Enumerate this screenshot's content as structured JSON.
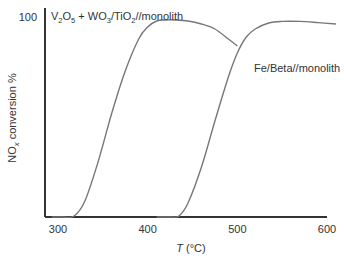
{
  "chart_data": {
    "type": "line",
    "title": "",
    "xlabel_italic": "T",
    "xlabel_rest": " (°C)",
    "ylabel_main": "NO",
    "ylabel_sub": "x",
    "ylabel_rest": " conversion %",
    "xlim": [
      285,
      610
    ],
    "ylim": [
      0,
      100
    ],
    "x_ticks": [
      300,
      400,
      500,
      600
    ],
    "x_tick_labels": [
      "300",
      "400",
      "500",
      "600"
    ],
    "y_ticks": [
      100
    ],
    "y_tick_labels": [
      "100"
    ],
    "grid": false,
    "series": [
      {
        "name": "V2O5 + WO3/TiO2//monolith",
        "label_parts": [
          "V",
          "2",
          "O",
          "5",
          " + WO",
          "3",
          "/TiO",
          "2",
          "//monolith"
        ],
        "color": "#777777",
        "x": [
          293,
          305,
          318,
          330,
          345,
          360,
          375,
          390,
          400,
          410,
          420,
          430,
          445,
          460,
          475,
          490,
          500
        ],
        "y": [
          0,
          0,
          0.5,
          8,
          28,
          52,
          73,
          89,
          95,
          98,
          98.5,
          98.5,
          98,
          96.5,
          94,
          89,
          85.5
        ]
      },
      {
        "name": "Fe/Beta//monolith",
        "label_parts": [
          "Fe/Beta//monolith"
        ],
        "color": "#777777",
        "x": [
          410,
          420,
          428,
          435,
          445,
          460,
          475,
          490,
          500,
          510,
          520,
          535,
          550,
          570,
          590,
          610
        ],
        "y": [
          0,
          0,
          0,
          0.5,
          7,
          25,
          48,
          70,
          82,
          90,
          94,
          97,
          97.8,
          97.8,
          97.2,
          96.5
        ]
      }
    ]
  }
}
